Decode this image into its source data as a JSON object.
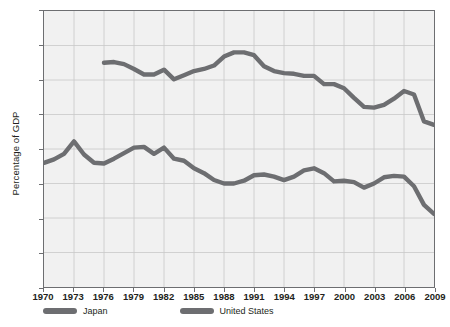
{
  "chart_data": {
    "type": "line",
    "title": "",
    "xlabel": "",
    "ylabel": "Percentage of GDP",
    "ylim": [
      0,
      40
    ],
    "ytick_values": [
      0,
      5,
      10,
      15,
      20,
      25,
      30,
      35,
      40
    ],
    "ytick_labels": [
      "0",
      "5",
      "10",
      "15",
      "20",
      "25",
      "30",
      "35",
      "40"
    ],
    "xlim": [
      1970,
      2009
    ],
    "xtick_values": [
      1970,
      1973,
      1976,
      1979,
      1982,
      1985,
      1988,
      1991,
      1994,
      1997,
      2000,
      2003,
      2006,
      2009
    ],
    "xtick_labels": [
      "1970",
      "1973",
      "1976",
      "1979",
      "1982",
      "1985",
      "1988",
      "1991",
      "1994",
      "1997",
      "2000",
      "2003",
      "2006",
      "2009"
    ],
    "grid": true,
    "legend_position": "bottom-left",
    "series": [
      {
        "name": "Japan",
        "color": "#6d6e71",
        "x": [
          1970,
          1971,
          1972,
          1973,
          1974,
          1975,
          1976,
          1977,
          1978,
          1979,
          1980,
          1981,
          1982,
          1983,
          1984,
          1985,
          1986,
          1987,
          1988,
          1989,
          1990,
          1991,
          1992,
          1993,
          1994,
          1995,
          1996,
          1997,
          1998,
          1999,
          2000,
          2001,
          2002,
          2003,
          2004,
          2005,
          2006,
          2007,
          2008,
          2009
        ],
        "values": [
          18.0,
          18.5,
          19.3,
          21.1,
          19.2,
          18.0,
          17.9,
          18.6,
          19.4,
          20.2,
          20.3,
          19.3,
          20.2,
          18.6,
          18.3,
          17.2,
          16.5,
          15.5,
          15.0,
          15.0,
          15.4,
          16.2,
          16.3,
          16.0,
          15.5,
          16.0,
          16.9,
          17.2,
          16.5,
          15.3,
          15.4,
          15.2,
          14.4,
          15.0,
          15.9,
          16.1,
          16.0,
          14.6,
          11.9,
          10.6
        ]
      },
      {
        "name": "United States",
        "color": "#6d6e71",
        "x": [
          1976,
          1977,
          1978,
          1979,
          1980,
          1981,
          1982,
          1983,
          1984,
          1985,
          1986,
          1987,
          1988,
          1989,
          1990,
          1991,
          1992,
          1993,
          1994,
          1995,
          1996,
          1997,
          1998,
          1999,
          2000,
          2001,
          2002,
          2003,
          2004,
          2005,
          2006,
          2007,
          2008,
          2009
        ],
        "values": [
          32.5,
          32.6,
          32.3,
          31.6,
          30.8,
          30.8,
          31.5,
          30.1,
          30.7,
          31.3,
          31.6,
          32.1,
          33.4,
          34.0,
          34.0,
          33.6,
          32.0,
          31.3,
          31.0,
          30.9,
          30.6,
          30.6,
          29.4,
          29.4,
          28.8,
          27.4,
          26.1,
          26.0,
          26.4,
          27.3,
          28.4,
          27.9,
          24.0,
          23.5
        ]
      }
    ]
  },
  "legend": {
    "items": [
      {
        "label": "Japan"
      },
      {
        "label": "United States"
      }
    ]
  }
}
